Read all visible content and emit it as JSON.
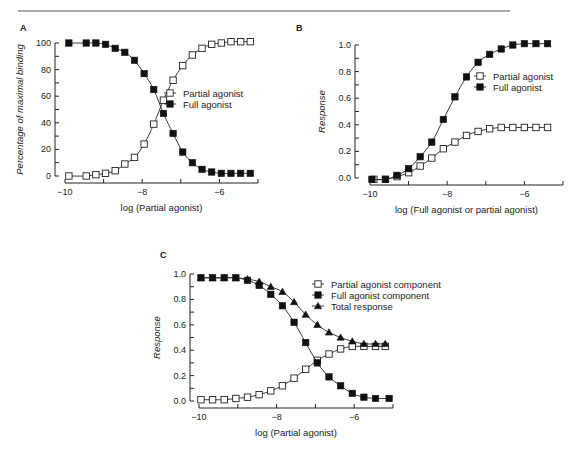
{
  "figure": {
    "top_rule": true
  },
  "chart_data": [
    {
      "panel": "A",
      "type": "line",
      "xlabel": "log (Partial agonist)",
      "ylabel": "Percentage of maximal binding",
      "xlim": [
        -10,
        -5
      ],
      "ylim": [
        0,
        100
      ],
      "xticks": [
        -10,
        -9,
        -8,
        -7,
        -6,
        -5
      ],
      "xtick_labels": [
        "−10",
        "",
        "−8",
        "",
        "−6",
        ""
      ],
      "yticks": [
        0,
        10,
        20,
        30,
        40,
        50,
        60,
        70,
        80,
        90,
        100
      ],
      "ytick_labels": [
        "0",
        "",
        "20",
        "",
        "40",
        "",
        "60",
        "",
        "80",
        "",
        "100"
      ],
      "grid": false,
      "legend_position": "center-right",
      "frame": {
        "left": 55,
        "top": 43,
        "right": 260,
        "bottom": 176,
        "xaxis_y": 183,
        "yaxis_x": 55,
        "x0": 65,
        "x1": 258
      },
      "legend": {
        "x": 170,
        "y": 93
      },
      "series": [
        {
          "name": "Partial agonist",
          "marker": "open-square",
          "x": [
            -9.9,
            -9.45,
            -9.2,
            -8.95,
            -8.7,
            -8.45,
            -8.2,
            -7.95,
            -7.7,
            -7.45,
            -7.2,
            -6.95,
            -6.7,
            -6.45,
            -6.2,
            -5.95,
            -5.7,
            -5.45,
            -5.2
          ],
          "y": [
            0,
            0,
            1,
            2,
            4,
            9,
            14,
            24,
            39,
            57,
            72,
            83,
            91,
            96,
            99,
            100,
            101,
            101,
            101
          ]
        },
        {
          "name": "Full agonist",
          "marker": "filled-square",
          "x": [
            -9.9,
            -9.45,
            -9.2,
            -8.95,
            -8.7,
            -8.45,
            -8.2,
            -7.95,
            -7.7,
            -7.45,
            -7.2,
            -6.95,
            -6.7,
            -6.45,
            -6.2,
            -5.95,
            -5.7,
            -5.45,
            -5.2
          ],
          "y": [
            100,
            100,
            100,
            99,
            96,
            93,
            87,
            77,
            65,
            47,
            32,
            18,
            10,
            5,
            3,
            2,
            2,
            2,
            2
          ]
        }
      ]
    },
    {
      "panel": "B",
      "type": "line",
      "xlabel": "log (Full agonist or partial agonist)",
      "ylabel": "Response",
      "xlim": [
        -10,
        -5
      ],
      "ylim": [
        0,
        1.0
      ],
      "xticks": [
        -10,
        -9,
        -8,
        -7,
        -6,
        -5
      ],
      "xtick_labels": [
        "−10",
        "",
        "−8",
        "",
        "−6",
        ""
      ],
      "yticks": [
        0,
        0.1,
        0.2,
        0.3,
        0.4,
        0.5,
        0.6,
        0.7,
        0.8,
        0.9,
        1.0
      ],
      "ytick_labels": [
        "0.0",
        "",
        "0.2",
        "",
        "0.4",
        "",
        "0.6",
        "",
        "0.8",
        "",
        "1.0"
      ],
      "grid": false,
      "legend_position": "center-right",
      "frame": {
        "left": 355,
        "top": 45,
        "right": 563,
        "bottom": 178,
        "xaxis_y": 185,
        "yaxis_x": 355,
        "x0": 370,
        "x1": 563
      },
      "legend": {
        "x": 480,
        "y": 76
      },
      "series": [
        {
          "name": "Partial agonist",
          "marker": "open-square",
          "x": [
            -9.9,
            -9.6,
            -9.3,
            -9.0,
            -8.7,
            -8.4,
            -8.1,
            -7.8,
            -7.5,
            -7.2,
            -6.9,
            -6.6,
            -6.3,
            -6.0,
            -5.7,
            -5.4
          ],
          "y": [
            -0.01,
            -0.01,
            0.01,
            0.04,
            0.09,
            0.15,
            0.22,
            0.27,
            0.32,
            0.35,
            0.37,
            0.38,
            0.38,
            0.38,
            0.38,
            0.38
          ]
        },
        {
          "name": "Full agonist",
          "marker": "filled-square",
          "x": [
            -9.95,
            -9.6,
            -9.3,
            -9.0,
            -8.7,
            -8.4,
            -8.1,
            -7.8,
            -7.5,
            -7.2,
            -6.9,
            -6.6,
            -6.3,
            -6.0,
            -5.7,
            -5.4
          ],
          "y": [
            -0.01,
            -0.01,
            0.02,
            0.07,
            0.16,
            0.27,
            0.44,
            0.61,
            0.76,
            0.87,
            0.93,
            0.97,
            1.0,
            1.01,
            1.01,
            1.01
          ]
        }
      ]
    },
    {
      "panel": "C",
      "type": "line",
      "xlabel": "log (Partial agonist)",
      "ylabel": "Response",
      "xlim": [
        -10,
        -5
      ],
      "ylim": [
        0,
        1.0
      ],
      "xticks": [
        -10,
        -9,
        -8,
        -7,
        -6,
        -5
      ],
      "xtick_labels": [
        "−10",
        "",
        "−8",
        "",
        "−6",
        ""
      ],
      "yticks": [
        0,
        0.1,
        0.2,
        0.3,
        0.4,
        0.5,
        0.6,
        0.7,
        0.8,
        0.9,
        1.0
      ],
      "ytick_labels": [
        "0.0",
        "",
        "0.2",
        "",
        "0.4",
        "",
        "0.6",
        "",
        "0.8",
        "",
        "1.0"
      ],
      "grid": false,
      "legend_position": "upper-right",
      "frame": {
        "left": 190,
        "top": 274,
        "right": 393,
        "bottom": 401,
        "xaxis_y": 408,
        "yaxis_x": 190,
        "x0": 199,
        "x1": 393
      },
      "legend": {
        "x": 318,
        "y": 284
      },
      "series": [
        {
          "name": "Partial agonist component",
          "marker": "open-square",
          "x": [
            -9.95,
            -9.65,
            -9.35,
            -9.05,
            -8.75,
            -8.45,
            -8.15,
            -7.85,
            -7.55,
            -7.25,
            -6.95,
            -6.65,
            -6.35,
            -6.05,
            -5.75,
            -5.45,
            -5.2
          ],
          "y": [
            0.01,
            0.01,
            0.01,
            0.02,
            0.03,
            0.05,
            0.08,
            0.12,
            0.18,
            0.25,
            0.32,
            0.37,
            0.41,
            0.43,
            0.43,
            0.43,
            0.43
          ]
        },
        {
          "name": "Full agonist component",
          "marker": "filled-square",
          "x": [
            -9.95,
            -9.65,
            -9.35,
            -9.05,
            -8.75,
            -8.45,
            -8.15,
            -7.85,
            -7.55,
            -7.25,
            -6.95,
            -6.65,
            -6.35,
            -6.05,
            -5.75,
            -5.45,
            -5.1
          ],
          "y": [
            0.97,
            0.97,
            0.97,
            0.97,
            0.95,
            0.91,
            0.84,
            0.75,
            0.62,
            0.46,
            0.3,
            0.19,
            0.12,
            0.06,
            0.03,
            0.02,
            0.02
          ]
        },
        {
          "name": "Total response",
          "marker": "filled-triangle",
          "x": [
            -9.95,
            -9.65,
            -9.35,
            -9.05,
            -8.75,
            -8.45,
            -8.15,
            -7.85,
            -7.55,
            -7.25,
            -6.95,
            -6.65,
            -6.35,
            -6.05,
            -5.75,
            -5.45,
            -5.2
          ],
          "y": [
            0.97,
            0.97,
            0.97,
            0.97,
            0.96,
            0.94,
            0.9,
            0.86,
            0.78,
            0.68,
            0.6,
            0.54,
            0.5,
            0.47,
            0.45,
            0.45,
            0.45
          ]
        }
      ]
    }
  ]
}
